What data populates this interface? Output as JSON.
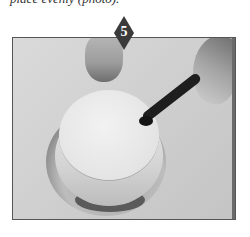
{
  "caption": {
    "text": "place evenly (photo)."
  },
  "step": {
    "number": "5",
    "badge_color": "#3a3a3a"
  },
  "photo": {
    "description": "Hands holding a frosted round cake on a cake stand while smoothing the top edge with a spatula",
    "background_color": "#d2d2d2",
    "border_color": "#555555"
  }
}
